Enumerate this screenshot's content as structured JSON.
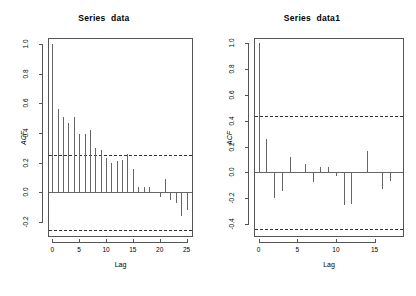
{
  "figure": {
    "kind": "acf-correlogram-pair",
    "width": 416,
    "height": 296,
    "background": "#ffffff",
    "foreground": "#555555",
    "bar_color": "#666666",
    "conf_color": "#333333"
  },
  "panels": [
    {
      "id": "left",
      "title": "Series  data",
      "xlabel": "Lag",
      "ylabel": "ACF"
    },
    {
      "id": "right",
      "title": "Series  data1",
      "xlabel": "Lag",
      "ylabel": "ACF"
    }
  ],
  "chart_data": [
    {
      "type": "bar",
      "id": "acf-series-data",
      "title": "Series  data",
      "xlabel": "Lag",
      "ylabel": "ACF",
      "grid": false,
      "legend": null,
      "xlim": [
        -0.8,
        26.2
      ],
      "ylim": [
        -0.3,
        1.04
      ],
      "xticks": [
        0,
        5,
        10,
        15,
        20,
        25
      ],
      "xticklabels": [
        "0",
        "5",
        "10",
        "15",
        "20",
        "25"
      ],
      "yticks": [
        -0.2,
        0.0,
        0.2,
        0.4,
        0.6,
        0.8,
        1.0
      ],
      "yticklabels": [
        "-0.2",
        "0.0",
        "0.2",
        "0.4",
        "0.6",
        "0.8",
        "1.0"
      ],
      "confidence_bands": [
        0.25,
        -0.25
      ],
      "categories": [
        0,
        1,
        2,
        3,
        4,
        5,
        6,
        7,
        8,
        9,
        10,
        11,
        12,
        13,
        14,
        15,
        16,
        17,
        18,
        19,
        20,
        21,
        22,
        23,
        24,
        25
      ],
      "values": [
        1.0,
        0.565,
        0.51,
        0.465,
        0.51,
        0.395,
        0.395,
        0.42,
        0.3,
        0.285,
        0.235,
        0.2,
        0.21,
        0.22,
        0.26,
        0.155,
        0.035,
        0.04,
        0.04,
        0.0,
        -0.03,
        0.09,
        -0.05,
        -0.07,
        -0.16,
        -0.12
      ]
    },
    {
      "type": "bar",
      "id": "acf-series-data1",
      "title": "Series  data1",
      "xlabel": "Lag",
      "ylabel": "ACF",
      "grid": false,
      "legend": null,
      "xlim": [
        -0.6,
        18.8
      ],
      "ylim": [
        -0.5,
        1.04
      ],
      "xticks": [
        0,
        5,
        10,
        15
      ],
      "xticklabels": [
        "0",
        "5",
        "10",
        "15"
      ],
      "yticks": [
        -0.4,
        -0.2,
        0.0,
        0.2,
        0.4,
        0.6,
        0.8,
        1.0
      ],
      "yticklabels": [
        "-0.4",
        "-0.2",
        "0.0",
        "0.2",
        "0.4",
        "0.6",
        "0.8",
        "1.0"
      ],
      "confidence_bands": [
        0.435,
        -0.435
      ],
      "categories": [
        0,
        1,
        2,
        3,
        4,
        5,
        6,
        7,
        8,
        9,
        10,
        11,
        12,
        13,
        14,
        15,
        16,
        17,
        18
      ],
      "values": [
        1.0,
        0.255,
        -0.195,
        -0.145,
        0.12,
        0.005,
        0.065,
        -0.075,
        0.04,
        0.04,
        -0.03,
        -0.25,
        -0.245,
        0.0,
        0.165,
        0.0,
        -0.13,
        -0.07,
        0.0
      ]
    }
  ]
}
